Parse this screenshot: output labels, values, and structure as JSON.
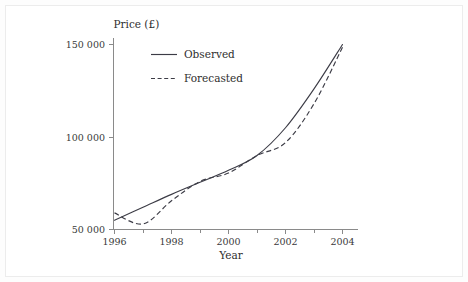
{
  "figure": {
    "background_color": "#fdfdfd",
    "panel_color": "#ffffff",
    "border_color": "#ececec",
    "ink_color": "#3c3c46",
    "axis_color": "#8a8a8a"
  },
  "chart_data": {
    "type": "line",
    "title": "",
    "subtitle": "",
    "xlabel": "Year",
    "ylabel": "Price (£)",
    "xlim": [
      1996,
      2004
    ],
    "ylim": [
      50000,
      150000
    ],
    "grid": false,
    "legend_position": "top-left-inside",
    "x_ticks": [
      1996,
      1998,
      2000,
      2002,
      2004
    ],
    "x_tick_labels": [
      "1996",
      "1998",
      "2000",
      "2002",
      "2004"
    ],
    "x_minor_ticks": [
      1997,
      1999,
      2001,
      2003
    ],
    "y_ticks": [
      50000,
      100000,
      150000
    ],
    "y_tick_labels": [
      "50 000",
      "100 000",
      "150 000"
    ],
    "x": [
      1996,
      1997,
      1998,
      1999,
      2000,
      2001,
      2002,
      2003,
      2004
    ],
    "series": [
      {
        "name": "Observed",
        "style": "solid",
        "color": "#3c3c46",
        "values": [
          55000,
          62000,
          69000,
          75500,
          82000,
          90000,
          105000,
          126000,
          150000
        ]
      },
      {
        "name": "Forecasted",
        "style": "dashed",
        "color": "#3c3c46",
        "values": [
          59000,
          53000,
          65500,
          76000,
          80500,
          90000,
          97000,
          118000,
          148500
        ]
      }
    ],
    "annotations": []
  },
  "legend": {
    "entries": [
      {
        "label": "Observed",
        "style": "solid"
      },
      {
        "label": "Forecasted",
        "style": "dashed"
      }
    ]
  },
  "axes": {
    "y_axis_title": "Price (£)",
    "x_axis_title": "Year"
  }
}
